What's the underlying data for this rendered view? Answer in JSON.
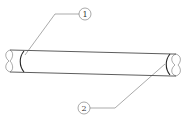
{
  "diagram": {
    "colors": {
      "line": "#333333",
      "background": "#ffffff"
    },
    "callouts": [
      {
        "id": "callout-1",
        "label": "1"
      },
      {
        "id": "callout-2",
        "label": "2"
      }
    ]
  }
}
